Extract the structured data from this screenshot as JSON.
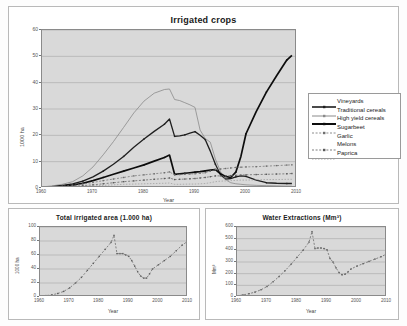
{
  "main": {
    "title": "Irrigated crops",
    "ylabel": "1000 ha",
    "xlabel": "Year",
    "yticks": [
      "0",
      "10",
      "20",
      "30",
      "40",
      "50",
      "60"
    ],
    "xticks": [
      "1960",
      "1970",
      "1980",
      "1990",
      "2000",
      "2010"
    ]
  },
  "legend": {
    "items": [
      {
        "label": "Vineyards",
        "key": "line-marker",
        "color": "#1f1f1f",
        "width": 1.6
      },
      {
        "label": "Traditional cereals",
        "key": "line-marker",
        "color": "#8a8a8a",
        "width": 1.0
      },
      {
        "label": "High yield cereals",
        "key": "line-marker",
        "color": "#0d0d0d",
        "width": 2.0
      },
      {
        "label": "Sugarbeet",
        "key": "dotted-marker",
        "color": "#6e6e6e",
        "width": 0.8
      },
      {
        "label": "Garlic",
        "key": "blank",
        "color": "#ffffff",
        "width": 0.0
      },
      {
        "label": "Melons",
        "key": "dotted-marker",
        "color": "#5a5a5a",
        "width": 0.8
      },
      {
        "label": "Paprica",
        "key": "thin-line",
        "color": "#9a9a9a",
        "width": 0.8
      }
    ]
  },
  "left": {
    "title": "Total irrigated area (1.000 ha)",
    "ylabel": "1000 ha",
    "xlabel": "Year",
    "yticks": [
      "0",
      "20",
      "40",
      "60",
      "80",
      "100"
    ],
    "xticks": [
      "1960",
      "1970",
      "1980",
      "1990",
      "2000",
      "2010"
    ]
  },
  "right": {
    "title": "Water Extractions (Mm³)",
    "ylabel": "Mm³",
    "xlabel": "Year",
    "yticks": [
      "0",
      "100",
      "200",
      "300",
      "400",
      "500",
      "600"
    ],
    "xticks": [
      "1960",
      "1970",
      "1980",
      "1990",
      "2000",
      "2010"
    ]
  },
  "chart_data": [
    {
      "type": "line",
      "id": "irrigated-crops",
      "title": "Irrigated crops",
      "xlabel": "Year",
      "ylabel": "1000 ha",
      "xlim": [
        1960,
        2010
      ],
      "ylim": [
        0,
        60
      ],
      "grid": true,
      "legend_position": "right",
      "x": [
        1960,
        1962,
        1964,
        1966,
        1968,
        1970,
        1972,
        1974,
        1976,
        1978,
        1980,
        1982,
        1984,
        1985,
        1986,
        1987,
        1988,
        1989,
        1990,
        1991,
        1992,
        1993,
        1994,
        1995,
        1996,
        1997,
        1998,
        1999,
        2000,
        2002,
        2004,
        2006,
        2008,
        2009
      ],
      "series": [
        {
          "name": "Vineyards",
          "color": "#1f1f1f",
          "values": [
            0.3,
            0.6,
            1.0,
            1.6,
            2.6,
            4.2,
            6.4,
            9.0,
            12.0,
            15.5,
            18.6,
            21.5,
            24.2,
            26.2,
            19.6,
            19.8,
            20.2,
            20.8,
            21.4,
            20.0,
            18.4,
            14.0,
            9.0,
            5.0,
            3.4,
            3.6,
            4.2,
            4.6,
            4.4,
            3.0,
            2.0,
            1.8,
            1.7,
            1.7
          ]
        },
        {
          "name": "Traditional cereals",
          "color": "#8a8a8a",
          "values": [
            0.4,
            0.8,
            1.4,
            2.4,
            4.6,
            8.0,
            12.6,
            17.6,
            23.0,
            28.5,
            33.0,
            36.0,
            37.4,
            37.6,
            33.6,
            33.2,
            32.4,
            31.6,
            30.6,
            22.0,
            18.8,
            17.4,
            11.0,
            6.2,
            3.2,
            2.0,
            1.6,
            1.4,
            1.2,
            1.0,
            0.9,
            0.8,
            0.7,
            0.7
          ]
        },
        {
          "name": "High yield cereals",
          "color": "#0d0d0d",
          "values": [
            0.2,
            0.4,
            0.7,
            1.1,
            1.8,
            2.8,
            4.0,
            5.2,
            6.4,
            7.6,
            8.8,
            10.2,
            11.6,
            12.5,
            5.2,
            5.4,
            5.6,
            5.8,
            6.0,
            6.2,
            6.5,
            6.8,
            7.0,
            5.4,
            4.4,
            4.0,
            6.0,
            12.0,
            20.6,
            29.0,
            36.4,
            42.6,
            48.6,
            50.4
          ]
        },
        {
          "name": "Sugarbeet",
          "color": "#6e6e6e",
          "values": [
            0.2,
            0.4,
            0.7,
            1.0,
            1.5,
            2.1,
            2.8,
            3.4,
            4.0,
            4.6,
            5.0,
            5.4,
            5.8,
            6.1,
            5.0,
            5.1,
            5.2,
            5.3,
            5.4,
            5.6,
            5.8,
            6.4,
            7.0,
            7.2,
            7.4,
            7.6,
            7.8,
            7.9,
            8.0,
            8.1,
            8.3,
            8.5,
            8.7,
            8.8
          ]
        },
        {
          "name": "Garlic",
          "color": "#ffffff",
          "values": [
            0,
            0,
            0,
            0,
            0,
            0,
            0,
            0,
            0,
            0,
            0,
            0,
            0,
            0,
            0,
            0,
            0,
            0,
            0,
            0,
            0,
            0,
            0,
            0,
            0,
            0,
            0,
            0,
            0,
            0,
            0,
            0,
            0,
            0
          ]
        },
        {
          "name": "Melons",
          "color": "#5a5a5a",
          "values": [
            0.1,
            0.2,
            0.4,
            0.6,
            0.9,
            1.2,
            1.6,
            2.0,
            2.4,
            2.7,
            3.0,
            3.3,
            3.6,
            3.8,
            3.2,
            3.3,
            3.4,
            3.5,
            3.6,
            3.8,
            4.0,
            4.3,
            4.6,
            4.6,
            4.6,
            4.7,
            4.8,
            4.9,
            5.0,
            5.1,
            5.2,
            5.3,
            5.4,
            5.5
          ]
        },
        {
          "name": "Paprica",
          "color": "#9a9a9a",
          "values": [
            0.1,
            0.15,
            0.25,
            0.4,
            0.6,
            0.8,
            1.0,
            1.2,
            1.4,
            1.5,
            1.6,
            1.7,
            1.8,
            1.9,
            1.4,
            1.4,
            1.45,
            1.5,
            1.5,
            1.6,
            1.7,
            2.0,
            2.4,
            2.6,
            2.7,
            2.8,
            2.9,
            3.0,
            3.0,
            3.1,
            3.2,
            3.2,
            3.3,
            3.3
          ]
        }
      ]
    },
    {
      "type": "line",
      "id": "total-irrigated-area",
      "title": "Total irrigated area (1.000 ha)",
      "xlabel": "Year",
      "ylabel": "1000 ha",
      "xlim": [
        1960,
        2010
      ],
      "ylim": [
        0,
        100
      ],
      "grid": true,
      "x": [
        1960,
        1962,
        1964,
        1966,
        1968,
        1970,
        1972,
        1974,
        1976,
        1978,
        1980,
        1982,
        1984,
        1985,
        1986,
        1987,
        1988,
        1989,
        1990,
        1991,
        1992,
        1993,
        1994,
        1995,
        1996,
        1997,
        1998,
        2000,
        2002,
        2004,
        2006,
        2008,
        2010
      ],
      "values": [
        1,
        2,
        3,
        5,
        8,
        13,
        20,
        28,
        38,
        48,
        58,
        68,
        78,
        88,
        62,
        62,
        62,
        60,
        58,
        52,
        44,
        36,
        30,
        27,
        27,
        33,
        40,
        46,
        52,
        58,
        66,
        74,
        80
      ]
    },
    {
      "type": "line",
      "id": "water-extractions",
      "title": "Water Extractions (Mm³)",
      "xlabel": "Year",
      "ylabel": "Mm³",
      "xlim": [
        1960,
        2010
      ],
      "ylim": [
        0,
        600
      ],
      "grid": true,
      "x": [
        1960,
        1962,
        1964,
        1966,
        1968,
        1970,
        1972,
        1974,
        1976,
        1978,
        1980,
        1982,
        1984,
        1985,
        1986,
        1987,
        1988,
        1989,
        1990,
        1991,
        1992,
        1993,
        1994,
        1995,
        1996,
        1997,
        1998,
        2000,
        2002,
        2004,
        2006,
        2008,
        2010
      ],
      "values": [
        10,
        18,
        28,
        42,
        62,
        90,
        130,
        175,
        225,
        280,
        340,
        400,
        470,
        560,
        415,
        420,
        420,
        415,
        405,
        330,
        300,
        250,
        210,
        190,
        195,
        215,
        240,
        265,
        285,
        305,
        325,
        345,
        370
      ]
    }
  ]
}
